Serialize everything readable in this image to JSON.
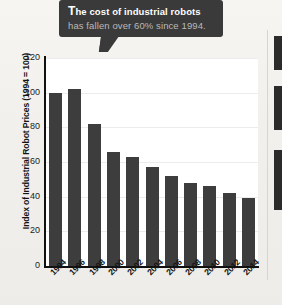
{
  "callout": {
    "dropcap": "T",
    "lead": "he cost of industrial robots",
    "rest": " has fallen over 60% since 1994.",
    "full_text": "The cost of industrial robots has fallen over 60% since 1994.",
    "background_color": "#3a3a3a",
    "lead_color": "#ffffff",
    "rest_color": "#b9b9b9"
  },
  "chart_data": {
    "type": "bar",
    "title": "",
    "subtitle": "",
    "xlabel": "",
    "ylabel": "Index of Industrial Robot Prices (1994 = 100)",
    "categories": [
      "1994",
      "1996",
      "1998",
      "2000",
      "2002",
      "2004",
      "2006",
      "2008",
      "2010",
      "2012",
      "2014"
    ],
    "values": [
      100,
      102,
      82,
      66,
      63,
      57,
      52,
      48,
      46,
      42,
      39
    ],
    "ylim": [
      0,
      120
    ],
    "ytick_labels": [
      "0",
      "20",
      "40",
      "60",
      "80",
      "100",
      "120"
    ],
    "ytick_values": [
      0,
      20,
      40,
      60,
      80,
      100,
      120
    ],
    "grid": true,
    "legend": "none",
    "bar_color": "#3d3d3d",
    "axis_color": "#111111",
    "plot_background": "#ffffff",
    "page_background": "#f2f0ec"
  }
}
